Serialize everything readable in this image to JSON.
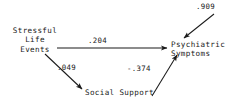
{
  "diagram": {
    "type": "path-diagram",
    "background_color": "#ffffff",
    "ink_color": "#1a1a1a",
    "nodes": [
      {
        "id": "stressful-life-events",
        "label": "Stressful\nLife\nEvents",
        "lines": [
          "Stressful",
          "Life",
          "Events"
        ]
      },
      {
        "id": "social-support",
        "label": "Social Support",
        "lines": [
          "Social Support"
        ]
      },
      {
        "id": "psychiatric-symptoms",
        "label": "Psychiatric\nSymptoms",
        "lines": [
          "Psychiatric",
          "Symptoms"
        ]
      }
    ],
    "coefficients": {
      "disturbance": ".909",
      "direct_effect": ".204",
      "events_to_support": ".049",
      "support_to_symptoms": "-.374"
    },
    "edges": [
      {
        "id": "events-to-symptoms",
        "from": "stressful-life-events",
        "to": "psychiatric-symptoms",
        "value": ".204",
        "style": "straight-horizontal"
      },
      {
        "id": "events-to-support",
        "from": "stressful-life-events",
        "to": "social-support",
        "value": ".049",
        "style": "diagonal-down-right"
      },
      {
        "id": "support-to-symptoms",
        "from": "social-support",
        "to": "psychiatric-symptoms",
        "value": "-.374",
        "style": "diagonal-up-right"
      },
      {
        "id": "disturbance-to-symptoms",
        "from": "disturbance",
        "to": "psychiatric-symptoms",
        "value": ".909",
        "style": "diagonal-down-left"
      }
    ]
  }
}
